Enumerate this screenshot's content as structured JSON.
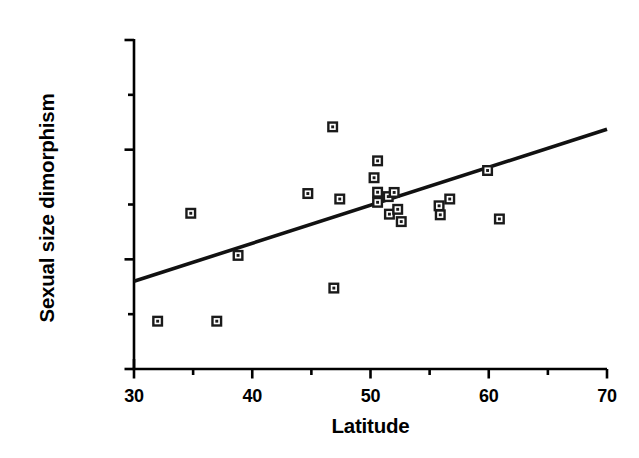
{
  "chart_data": {
    "type": "scatter",
    "title": "",
    "xlabel": "Latitude",
    "ylabel": "Sexual size dimorphism",
    "xlim": [
      30,
      70
    ],
    "ylim": [
      0.0,
      0.015
    ],
    "xticks": [
      30,
      40,
      50,
      60,
      70
    ],
    "xtick_labels": [
      "30",
      "40",
      "50",
      "60",
      "70"
    ],
    "xminor_ticks": [
      35,
      45,
      55,
      65
    ],
    "yticks": [
      0.0,
      0.005,
      0.01,
      0.015
    ],
    "ytick_labels": [
      "0.000",
      "0.005",
      "0.010",
      "0.015"
    ],
    "yminor_ticks": [
      0.0025,
      0.0075,
      0.0125
    ],
    "grid": false,
    "legend": false,
    "marker": "open-square-in-filled-square",
    "marker_color": "#1a1a1a",
    "line_color": "#111111",
    "points": [
      {
        "x": 32.0,
        "y": 0.00218
      },
      {
        "x": 34.8,
        "y": 0.0071
      },
      {
        "x": 37.0,
        "y": 0.00218
      },
      {
        "x": 38.8,
        "y": 0.00518
      },
      {
        "x": 44.7,
        "y": 0.008
      },
      {
        "x": 46.8,
        "y": 0.01104
      },
      {
        "x": 46.9,
        "y": 0.00369
      },
      {
        "x": 47.4,
        "y": 0.00775
      },
      {
        "x": 50.3,
        "y": 0.00872
      },
      {
        "x": 50.6,
        "y": 0.00949
      },
      {
        "x": 50.6,
        "y": 0.00806
      },
      {
        "x": 50.6,
        "y": 0.0076
      },
      {
        "x": 51.5,
        "y": 0.00786
      },
      {
        "x": 51.6,
        "y": 0.00706
      },
      {
        "x": 52.0,
        "y": 0.00805
      },
      {
        "x": 52.3,
        "y": 0.00728
      },
      {
        "x": 52.6,
        "y": 0.00672
      },
      {
        "x": 55.8,
        "y": 0.00744
      },
      {
        "x": 55.9,
        "y": 0.00703
      },
      {
        "x": 56.7,
        "y": 0.00775
      },
      {
        "x": 59.9,
        "y": 0.00905
      },
      {
        "x": 60.9,
        "y": 0.00684
      }
    ],
    "trendline": {
      "name": "regression line",
      "x": [
        30,
        70
      ],
      "y": [
        0.004,
        0.01093
      ]
    }
  }
}
